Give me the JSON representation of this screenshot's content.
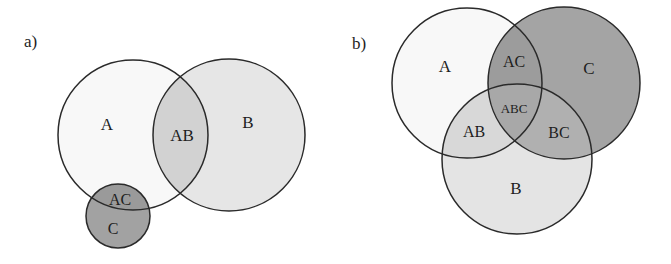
{
  "colors": {
    "background": "#ffffff",
    "white_region": "#f8f8f8",
    "light_region": "#e4e4e4",
    "mid_region": "#c4c4c4",
    "dark_region": "#9a9a9a",
    "stroke": "#2a2a2a"
  },
  "panel_a": {
    "label": "a)",
    "circles": [
      {
        "name": "A",
        "cx": 133,
        "cy": 135,
        "r": 75
      },
      {
        "name": "B",
        "cx": 229,
        "cy": 135,
        "r": 76
      },
      {
        "name": "C",
        "cx": 118,
        "cy": 216,
        "r": 32
      }
    ],
    "regions": {
      "A": "A",
      "AB": "AB",
      "B": "B",
      "AC": "AC",
      "C": "C"
    }
  },
  "panel_b": {
    "label": "b)",
    "circles": [
      {
        "name": "A",
        "cx": 467,
        "cy": 83,
        "r": 75
      },
      {
        "name": "C",
        "cx": 564,
        "cy": 83,
        "r": 76
      },
      {
        "name": "B",
        "cx": 517,
        "cy": 159,
        "r": 75
      }
    ],
    "regions": {
      "A": "A",
      "AC": "AC",
      "C": "C",
      "ABC": "ABC",
      "AB": "AB",
      "BC": "BC",
      "B": "B"
    }
  }
}
